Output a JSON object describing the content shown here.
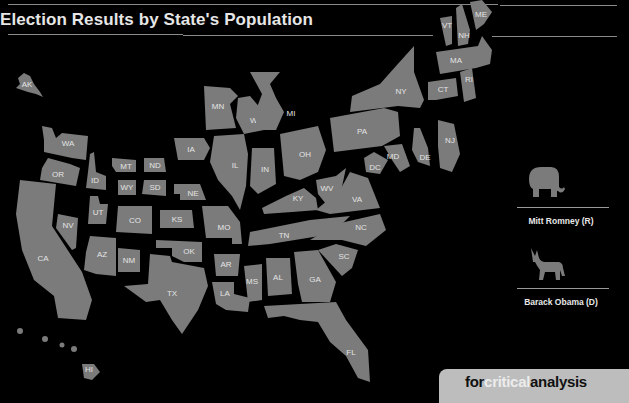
{
  "title": "Election Results by State's Population",
  "legend": {
    "republican": {
      "label": "Mitt Romney (R)",
      "icon": "elephant-icon"
    },
    "democrat": {
      "label": "Barack Obama (D)",
      "icon": "donkey-icon"
    }
  },
  "badge": {
    "part1": "for",
    "part2": "critical",
    "part3": "analysis"
  },
  "colors": {
    "background": "#000000",
    "state_fill": "#7b7b7b",
    "label": "#e4e4e4",
    "badge_bg": "#bdbdbd"
  },
  "states": {
    "AK": "AK",
    "WA": "WA",
    "OR": "OR",
    "CA": "CA",
    "NV": "NV",
    "ID": "ID",
    "UT": "UT",
    "AZ": "AZ",
    "MT": "MT",
    "WY": "WY",
    "CO": "CO",
    "NM": "NM",
    "ND": "ND",
    "SD": "SD",
    "NE": "NE",
    "KS": "KS",
    "OK": "OK",
    "TX": "TX",
    "MN": "MN",
    "IA": "IA",
    "MO": "MO",
    "AR": "AR",
    "LA": "LA",
    "WI": "WI",
    "IL": "IL",
    "MI": "MI",
    "IN": "IN",
    "OH": "OH",
    "KY": "KY",
    "TN": "TN",
    "MS": "MS",
    "AL": "AL",
    "GA": "GA",
    "FL": "FL",
    "SC": "SC",
    "NC": "NC",
    "VA": "VA",
    "WV": "WV",
    "DC": "DC",
    "MD": "MD",
    "DE": "DE",
    "PA": "PA",
    "NJ": "NJ",
    "NY": "NY",
    "CT": "CT",
    "RI": "RI",
    "MA": "MA",
    "VT": "VT",
    "NH": "NH",
    "ME": "ME",
    "HI": "HI"
  }
}
